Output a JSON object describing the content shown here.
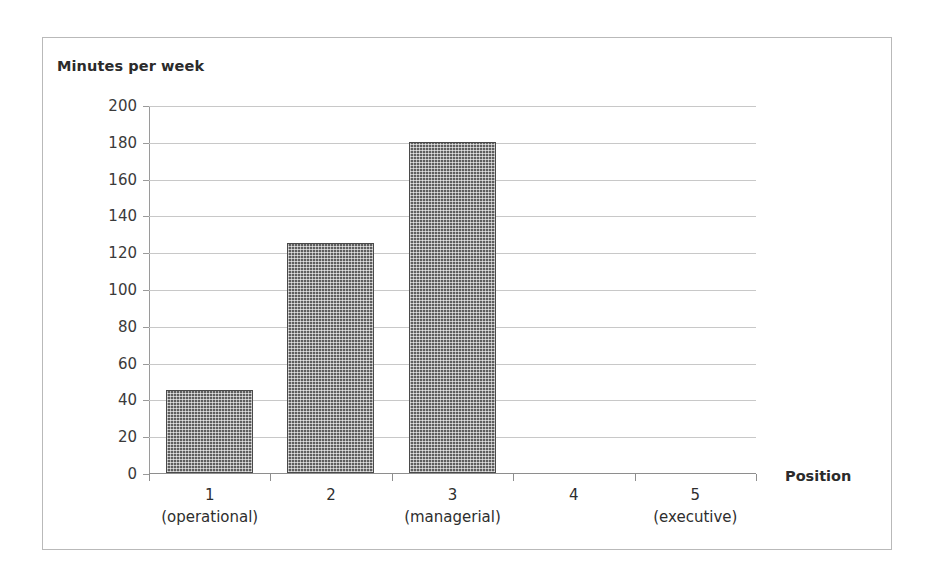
{
  "figure": {
    "background_color": "#ffffff",
    "border_color": "#b9b9b9"
  },
  "chart_data": {
    "type": "bar",
    "title": "",
    "ylabel": "Minutes per week",
    "xlabel": "Position",
    "categories": [
      "1",
      "2",
      "3",
      "4",
      "5"
    ],
    "category_sublabels": [
      "(operational)",
      "",
      "(managerial)",
      "",
      "(executive)"
    ],
    "values": [
      45,
      125,
      180,
      0,
      0
    ],
    "ylim": [
      0,
      200
    ],
    "ytick_labels": [
      "200",
      "180",
      "160",
      "140",
      "120",
      "100",
      "80",
      "60",
      "40",
      "20",
      "0"
    ],
    "ytick_values": [
      200,
      180,
      160,
      140,
      120,
      100,
      80,
      60,
      40,
      20,
      0
    ],
    "ytick_step": 20,
    "grid": true,
    "grid_axis": "y",
    "legend": false,
    "legend_position": "none",
    "bar_color": "#5e5e5e",
    "bar_pattern": "fine-checkered-dots",
    "grid_color": "#c8c8c8",
    "axis_color": "#8e8e8e"
  },
  "icons": {}
}
